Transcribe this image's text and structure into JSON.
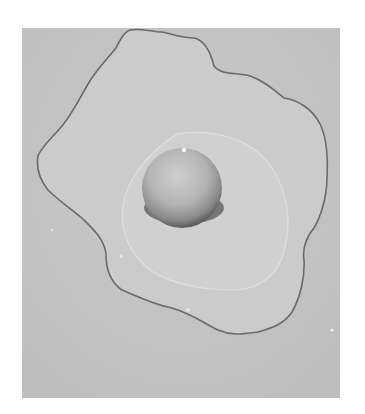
{
  "image": {
    "subject": "Fried egg on a flat surface, black-and-white photograph",
    "style": "grayscale",
    "colors": {
      "background": "#ffffff",
      "surface": "#c4c4c4",
      "egg_white": "#cbcbcb",
      "egg_white_edge": "#6f6f6f",
      "inner_white": "#d0d0d0",
      "yolk": "#b6b6b6",
      "yolk_shadow": "#3a3a3a"
    }
  }
}
